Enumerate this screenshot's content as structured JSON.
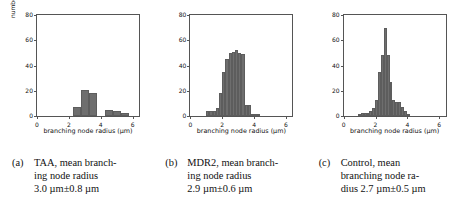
{
  "figure": {
    "axis_label_x": "branching node radius (µm)",
    "axis_label_y": "number of branching nodes"
  },
  "panels": [
    {
      "tag": "(a)",
      "caption_line1": "TAA, mean branch-",
      "caption_line2": "ing node radius",
      "caption_line3": "3.0 µm±0.8 µm",
      "caption_full": "(a) TAA, mean branching node radius 3.0 µm±0.8 µm",
      "condition": "TAA",
      "mean": "3.0 µm",
      "sd": "0.8 µm"
    },
    {
      "tag": "(b)",
      "caption_line1": "MDR2, mean branch-",
      "caption_line2": "ing node radius",
      "caption_line3": "2.9 µm±0.6 µm",
      "caption_full": "(b) MDR2, mean branching node radius 2.9 µm±0.6 µm",
      "condition": "MDR2",
      "mean": "2.9 µm",
      "sd": "0.6 µm"
    },
    {
      "tag": "(c)",
      "caption_line1": "Control, mean",
      "caption_line2": "branching node ra-",
      "caption_line3": "dius 2.7 µm±0.5 µm",
      "caption_full": "(c) Control, mean branching node radius 2.7 µm±0.5 µm",
      "condition": "Control",
      "mean": "2.7 µm",
      "sd": "0.5 µm"
    }
  ],
  "chart_data": [
    {
      "type": "bar",
      "title": "TAA",
      "xlabel": "branching node radius (µm)",
      "ylabel": "number of branching nodes",
      "xlim": [
        0,
        6.4
      ],
      "ylim": [
        0,
        80
      ],
      "xticks": [
        0,
        2,
        4,
        6
      ],
      "yticks": [
        0,
        20,
        40,
        60,
        80
      ],
      "grid": false,
      "bar_color": "#6e6e6e",
      "bin_width": 0.5,
      "bins_left": [
        1.75,
        2.25,
        2.75,
        3.25,
        3.75,
        4.25,
        4.75,
        5.25
      ],
      "categories": [
        "1.75",
        "2.25",
        "2.75",
        "3.25",
        "3.75",
        "4.25",
        "4.75",
        "5.25"
      ],
      "values": [
        0,
        7,
        21,
        18,
        0,
        5,
        4,
        2
      ]
    },
    {
      "type": "bar",
      "title": "MDR2",
      "xlabel": "branching node radius (µm)",
      "ylabel": "number of branching nodes",
      "xlim": [
        0,
        6.4
      ],
      "ylim": [
        0,
        80
      ],
      "xticks": [
        0,
        2,
        4,
        6
      ],
      "yticks": [
        0,
        20,
        40,
        60,
        80
      ],
      "grid": false,
      "bar_color": "#6e6e6e",
      "bin_width": 0.2,
      "bins_left": [
        1.0,
        1.2,
        1.4,
        1.6,
        1.8,
        2.0,
        2.2,
        2.4,
        2.6,
        2.8,
        3.0,
        3.2,
        3.4,
        3.6,
        3.8,
        4.0,
        4.2,
        4.4,
        4.6
      ],
      "categories": [
        "1.0",
        "1.2",
        "1.4",
        "1.6",
        "1.8",
        "2.0",
        "2.2",
        "2.4",
        "2.6",
        "2.8",
        "3.0",
        "3.2",
        "3.4",
        "3.6",
        "3.8",
        "4.0",
        "4.2",
        "4.4",
        "4.6"
      ],
      "values": [
        4,
        4,
        4,
        6,
        18,
        35,
        45,
        50,
        51,
        52,
        50,
        49,
        9,
        9,
        1,
        1,
        1,
        0,
        0
      ]
    },
    {
      "type": "bar",
      "title": "Control",
      "xlabel": "branching node radius (µm)",
      "ylabel": "number of branching nodes",
      "xlim": [
        0,
        6.4
      ],
      "ylim": [
        0,
        80
      ],
      "xticks": [
        0,
        2,
        4,
        6
      ],
      "yticks": [
        0,
        20,
        40,
        60,
        80
      ],
      "grid": false,
      "bar_color": "#6e6e6e",
      "bin_width": 0.18,
      "bins_left": [
        0.9,
        1.08,
        1.26,
        1.44,
        1.62,
        1.8,
        1.98,
        2.16,
        2.34,
        2.52,
        2.7,
        2.88,
        3.06,
        3.24,
        3.42,
        3.6,
        3.78,
        3.96
      ],
      "categories": [
        "0.9",
        "1.08",
        "1.26",
        "1.44",
        "1.62",
        "1.8",
        "1.98",
        "2.16",
        "2.34",
        "2.52",
        "2.7",
        "2.88",
        "3.06",
        "3.24",
        "3.42",
        "3.6",
        "3.78",
        "3.96"
      ],
      "values": [
        1,
        2,
        2,
        2,
        4,
        6,
        13,
        35,
        48,
        70,
        48,
        27,
        13,
        11,
        11,
        7,
        4,
        1
      ]
    }
  ]
}
